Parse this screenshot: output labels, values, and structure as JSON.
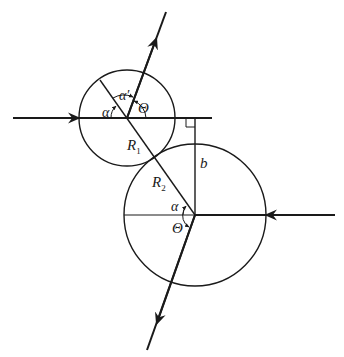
{
  "diagram": {
    "type": "scattering geometry — hard-sphere collision",
    "colors": {
      "stroke": "#1a1a1a",
      "background": "#ffffff"
    },
    "circles": [
      {
        "name": "sphere-1",
        "cx": 127,
        "cy": 118,
        "r": 48,
        "radius_label": "R",
        "radius_sub": "1"
      },
      {
        "name": "sphere-2",
        "cx": 195,
        "cy": 215,
        "r": 71,
        "radius_label": "R",
        "radius_sub": "2"
      }
    ],
    "labels": {
      "alpha": "α",
      "alpha_prime": "α′",
      "theta": "Θ",
      "impact_parameter": "b",
      "R": "R",
      "sub1": "1",
      "sub2": "2"
    }
  }
}
